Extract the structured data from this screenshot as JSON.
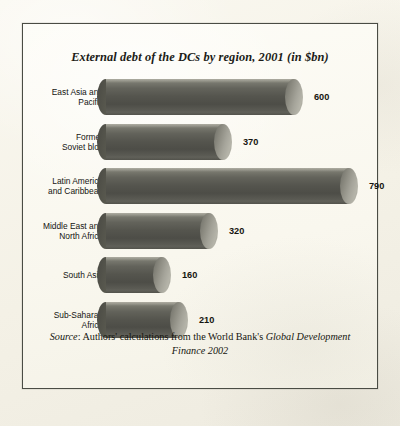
{
  "figure": {
    "title": "External debt of the DCs by region, 2001 (in $bn)",
    "source_prefix": "Source",
    "source_colon": ": ",
    "source_text_a": "Authors' calculations from the World Bank's ",
    "source_italic_a": "Global Development Finance",
    "source_text_b": " 2002",
    "source_full": "Source: Authors' calculations from the World Bank's Global Development Finance 2002",
    "frame_color": "#4a4c44",
    "background_color": "#fcfbf4",
    "bar_color": "#55554e",
    "bar_cap_color": "#b5b4a9"
  },
  "chart_data": {
    "type": "bar",
    "orientation": "horizontal",
    "title": "External debt of the DCs by region, 2001 (in $bn)",
    "xlabel": "",
    "ylabel": "",
    "unit": "$bn",
    "year": "2001",
    "grid": false,
    "legend": "none",
    "xlim": [
      0,
      790
    ],
    "categories": [
      "East Asia and Pacific",
      "Former Soviet bloc",
      "Latin America and Caribbean",
      "Middle East and North Africa",
      "South Asia",
      "Sub-Saharan Africa"
    ],
    "values": [
      600,
      370,
      790,
      320,
      160,
      210
    ],
    "bars": [
      {
        "label_line1": "East Asia and",
        "label_line2": "Pacific",
        "value": 600,
        "value_text": "600",
        "length_px": 197
      },
      {
        "label_line1": "Former",
        "label_line2": "Soviet bloc",
        "value": 370,
        "value_text": "370",
        "length_px": 126
      },
      {
        "label_line1": "Latin America",
        "label_line2": "and Caribbean",
        "value": 790,
        "value_text": "790",
        "length_px": 252
      },
      {
        "label_line1": "Middle East and",
        "label_line2": "North Africa",
        "value": 320,
        "value_text": "320",
        "length_px": 112
      },
      {
        "label_line1": "South Asia",
        "label_line2": "",
        "value": 160,
        "value_text": "160",
        "length_px": 65
      },
      {
        "label_line1": "Sub-Saharan",
        "label_line2": "Africa",
        "value": 210,
        "value_text": "210",
        "length_px": 82
      }
    ]
  }
}
